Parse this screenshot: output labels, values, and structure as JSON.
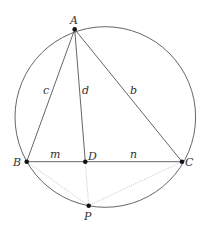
{
  "diagram": {
    "type": "geometry",
    "circle": {
      "cx": 105.3,
      "cy": 117,
      "r": 90.3
    },
    "points": {
      "A": {
        "label": "A",
        "x": 74.7,
        "y": 29.3
      },
      "B": {
        "label": "B",
        "x": 26.7,
        "y": 161.7
      },
      "C": {
        "label": "C",
        "x": 182.0,
        "y": 161.7
      },
      "D": {
        "label": "D",
        "x": 85.3,
        "y": 161.7
      },
      "P": {
        "label": "P",
        "x": 88.7,
        "y": 205.7
      }
    },
    "segments": {
      "c": {
        "label": "c",
        "from": "A",
        "to": "B"
      },
      "b": {
        "label": "b",
        "from": "A",
        "to": "C"
      },
      "d": {
        "label": "d",
        "from": "A",
        "to": "D"
      },
      "m": {
        "label": "m",
        "from": "B",
        "to": "D"
      },
      "n": {
        "label": "n",
        "from": "D",
        "to": "C"
      }
    },
    "dotted_segments": [
      "B-P",
      "D-P",
      "C-P"
    ],
    "colors": {
      "line": "#555555",
      "dotted": "#bbbbbb",
      "point": "#111111"
    }
  }
}
